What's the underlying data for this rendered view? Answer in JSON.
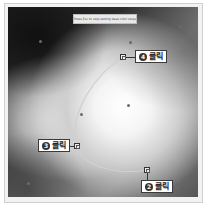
{
  "hint": {
    "text": "Press Esc to stop setting base color stops"
  },
  "callouts": [
    {
      "id": "step4",
      "number": "4",
      "label": "클릭"
    },
    {
      "id": "step3",
      "number": "3",
      "label": "클릭"
    },
    {
      "id": "step2",
      "number": "2",
      "label": "클릭"
    }
  ],
  "colors": {
    "callout_border": "#3a3a3a",
    "curve": "#bdbdbd",
    "canvas_dark": "#1e1e1e",
    "canvas_light": "#ffffff"
  }
}
